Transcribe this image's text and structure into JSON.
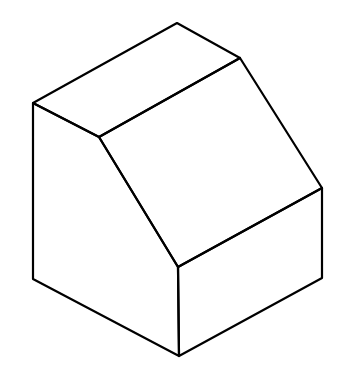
{
  "diagram": {
    "type": "isometric-line-drawing",
    "shape": "block with sloped face",
    "stroke_color": "#000000",
    "background": "#ffffff",
    "vertices": {
      "top": [
        177,
        23
      ],
      "top_right": [
        240,
        58
      ],
      "left_top": [
        33,
        103
      ],
      "inner": [
        99,
        137
      ],
      "right": [
        322,
        188
      ],
      "front_mid": [
        178,
        267
      ],
      "left_bottom": [
        33,
        279
      ],
      "right_bottom": [
        322,
        278
      ],
      "bottom": [
        179,
        356
      ]
    }
  }
}
